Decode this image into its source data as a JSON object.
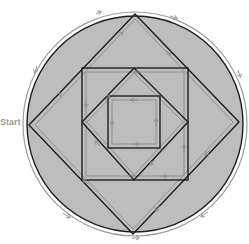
{
  "diagram": {
    "start_label": "Start",
    "colors": {
      "fill": "#bdbdbd",
      "edge": "#1e1e1e",
      "path": "#8a8a8a",
      "outer_ring": "#9c9c9c",
      "label": "#9a9a9a"
    },
    "shapes": [
      {
        "name": "outer-circle",
        "type": "circle",
        "cx": 135,
        "cy": 124,
        "r": 108
      },
      {
        "name": "outer-diamond",
        "type": "polygon",
        "points": [
          [
            135,
            14
          ],
          [
            239,
            122
          ],
          [
            133,
            234
          ],
          [
            29,
            125
          ]
        ]
      },
      {
        "name": "middle-square",
        "type": "rect",
        "x": 82,
        "y": 68,
        "w": 106,
        "h": 112
      },
      {
        "name": "inner-diamond",
        "type": "polygon",
        "points": [
          [
            134,
            68
          ],
          [
            188,
            122
          ],
          [
            134,
            180
          ],
          [
            82,
            122
          ]
        ]
      },
      {
        "name": "innermost-square",
        "type": "rect",
        "x": 108,
        "y": 96,
        "w": 52,
        "h": 52
      }
    ],
    "traversal": "Euler path starting at left vertex, with directional arrows along every edge"
  }
}
